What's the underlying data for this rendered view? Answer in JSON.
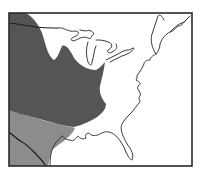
{
  "map": {
    "title": "",
    "region": "Eastern United States",
    "legend": [],
    "zones": [
      {
        "name": "northern-range",
        "shade": "dark",
        "color": "#555555"
      },
      {
        "name": "southern-range",
        "shade": "medium",
        "color": "#8c8c8c"
      },
      {
        "name": "unshaded",
        "shade": "none",
        "color": "#ffffff"
      }
    ],
    "colors": {
      "background": "#ffffff",
      "dark_zone": "#555555",
      "medium_zone": "#8c8c8c",
      "outline": "#333333",
      "frame": "#2a2a2a"
    }
  }
}
